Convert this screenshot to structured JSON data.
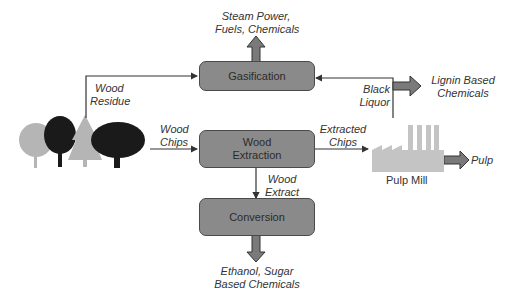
{
  "diagram": {
    "type": "process-flow",
    "processes": {
      "gasification": "Gasification",
      "wood_extraction_line1": "Wood",
      "wood_extraction_line2": "Extraction",
      "conversion": "Conversion"
    },
    "sources": {
      "trees": "forest-trees-icon",
      "pulp_mill": "Pulp Mill"
    },
    "flows": {
      "wood_residue_line1": "Wood",
      "wood_residue_line2": "Residue",
      "wood_chips_line1": "Wood",
      "wood_chips_line2": "Chips",
      "extracted_chips_line1": "Extracted",
      "extracted_chips_line2": "Chips",
      "wood_extract_line1": "Wood",
      "wood_extract_line2": "Extract",
      "black_liquor_line1": "Black",
      "black_liquor_line2": "Liquor"
    },
    "outputs": {
      "steam_line1": "Steam Power,",
      "steam_line2": "Fuels, Chemicals",
      "lignin_line1": "Lignin Based",
      "lignin_line2": "Chemicals",
      "ethanol_line1": "Ethanol, Sugar",
      "ethanol_line2": "Based Chemicals",
      "pulp": "Pulp"
    },
    "colors": {
      "box_fill": "#8a8a8a",
      "box_border": "#4a4a4a",
      "arrow_fill": "#7a7a7a",
      "line": "#333333",
      "mill": "#c4c4c4",
      "tree_light": "#b5b5b5",
      "tree_dark": "#1a1a1a"
    }
  }
}
